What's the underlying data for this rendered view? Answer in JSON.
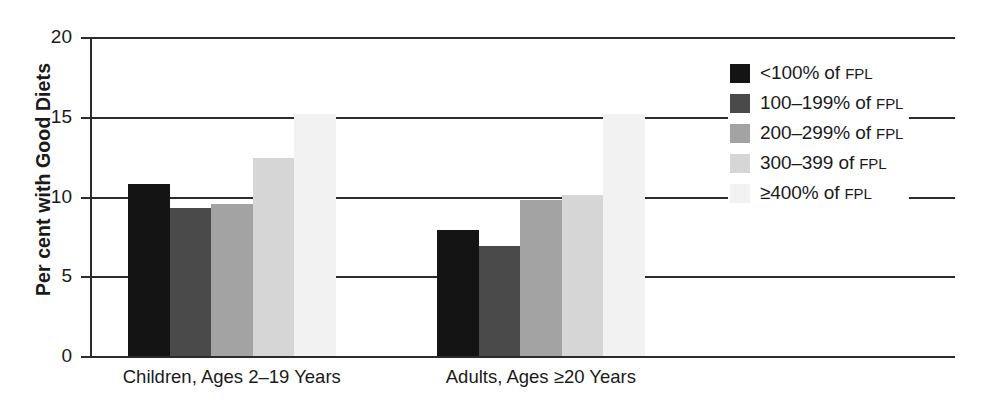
{
  "chart_data": {
    "type": "bar",
    "title": "",
    "xlabel": "",
    "ylabel": "Per cent with Good Diets",
    "ylim": [
      0,
      20
    ],
    "yticks": [
      0,
      5,
      10,
      15,
      20
    ],
    "ytick_labels": [
      "0",
      "5",
      "10",
      "15",
      "20"
    ],
    "grid": true,
    "legend_position": "right",
    "categories": [
      "Children, Ages 2–19 Years",
      "Adults, Ages ≥20 Years"
    ],
    "series": [
      {
        "name": "<100% of FPL",
        "label_main": "<100%",
        "label_tail": " of ",
        "label_sc": "FPL",
        "color": "#141414",
        "values": [
          10.8,
          7.9
        ]
      },
      {
        "name": "100–199% of FPL",
        "label_main": "100–199%",
        "label_tail": " of ",
        "label_sc": "FPL",
        "color": "#4a4a4a",
        "values": [
          9.3,
          6.9
        ]
      },
      {
        "name": "200–299% of FPL",
        "label_main": "200–299%",
        "label_tail": " of ",
        "label_sc": "FPL",
        "color": "#a3a3a3",
        "values": [
          9.5,
          9.8
        ]
      },
      {
        "name": "300–399 of FPL",
        "label_main": "300–399",
        "label_tail": " of ",
        "label_sc": "FPL",
        "color": "#d6d6d6",
        "values": [
          12.4,
          10.1
        ]
      },
      {
        "name": "≥400% of FPL",
        "label_main": "≥400%",
        "label_tail": " of ",
        "label_sc": "FPL",
        "color": "#f2f2f2",
        "values": [
          15.2,
          15.2
        ]
      }
    ]
  },
  "axis": {
    "y_title": "Per cent with Good Diets"
  }
}
